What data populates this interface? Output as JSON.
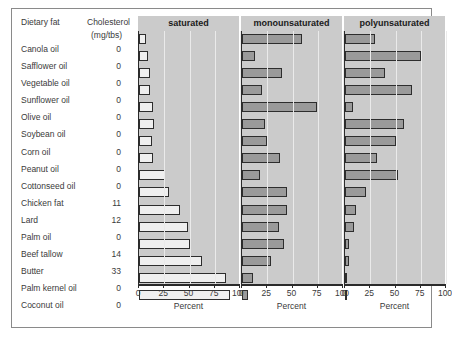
{
  "table": {
    "header_fat": "Dietary fat",
    "header_cholesterol": "Cholesterol",
    "header_units": "(mg/tbs)"
  },
  "axis": {
    "xlabel": "Percent",
    "ticks": [
      "0",
      "25",
      "50",
      "75",
      "100"
    ]
  },
  "colors": {
    "panel_background": "#cbcbcb",
    "gridline": "#eaeaea",
    "bar_saturated": "#efefef",
    "bar_monounsaturated": "#9a9a9a",
    "bar_polyunsaturated": "#9a9a9a",
    "bar_outline": "#2d2d2d",
    "axis": "#2b2b2b",
    "text": "#3a3a3a",
    "frame": "#8a8a8a"
  },
  "chart_data": {
    "type": "bar",
    "title": "",
    "xlabel": "Percent",
    "ylabel": "Dietary fat",
    "xlim": [
      0,
      100
    ],
    "grid": true,
    "legend_position": "panel-titles",
    "orientation": "horizontal",
    "panels": [
      "saturated",
      "monounsaturated",
      "polyunsaturated"
    ],
    "categories": [
      "Canola oil",
      "Safflower oil",
      "Vegetable oil",
      "Sunflower oil",
      "Olive oil",
      "Soybean oil",
      "Corn oil",
      "Peanut oil",
      "Cottonseed oil",
      "Chicken fat",
      "Lard",
      "Palm oil",
      "Beef tallow",
      "Butter",
      "Palm kernel oil",
      "Coconut oil"
    ],
    "cholesterol_mg_per_tbs": [
      0,
      0,
      0,
      0,
      0,
      0,
      0,
      0,
      0,
      11,
      12,
      0,
      14,
      33,
      0,
      0
    ],
    "series": [
      {
        "name": "saturated",
        "values": [
          7,
          9,
          11,
          11,
          14,
          15,
          13,
          14,
          26,
          30,
          41,
          49,
          50,
          62,
          86,
          90
        ]
      },
      {
        "name": "monounsaturated",
        "values": [
          59,
          13,
          40,
          20,
          74,
          23,
          25,
          38,
          18,
          45,
          45,
          37,
          42,
          29,
          11,
          6
        ]
      },
      {
        "name": "polyunsaturated",
        "values": [
          30,
          75,
          40,
          66,
          8,
          58,
          50,
          32,
          52,
          21,
          11,
          9,
          4,
          4,
          2,
          2
        ]
      }
    ]
  }
}
